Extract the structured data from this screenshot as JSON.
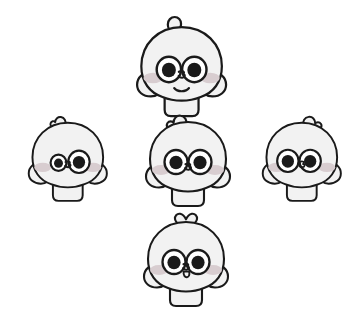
{
  "canvas": {
    "width": 342,
    "height": 306,
    "background_color": "#ffffff"
  },
  "palette": {
    "outline": "#1a1a1a",
    "body_fill": "#f2f2f2",
    "body_shade": "#e8e8e8",
    "cheek": "#d8cdd0",
    "pupil": "#1a1a1a",
    "eye_white": "#ffffff"
  },
  "scene": {
    "title": "Cartoon character expression sheet",
    "description": "Five identical round cartoon characters arranged in a plus/diamond formation, each showing a different facial expression and head tuft.",
    "layout": "diamond",
    "character_count": 5
  },
  "characters": [
    {
      "id": "top",
      "name": "character-top",
      "position_label": "top-center",
      "x": 118,
      "y": 8,
      "scale": 1.06,
      "tuft": "small-round-bump",
      "tuft_side": "left",
      "expression": "happy-smile",
      "gaze": "center",
      "mouth": "smile-curve",
      "left_eye": {
        "size": "large",
        "pupil": "large",
        "offset_x": 0,
        "offset_y": 0
      },
      "right_eye": {
        "size": "large",
        "pupil": "large",
        "offset_x": 0,
        "offset_y": 0
      },
      "cheeks": "both",
      "has_body": true
    },
    {
      "id": "left",
      "name": "character-left",
      "position_label": "middle-left",
      "x": 12,
      "y": 106,
      "scale": 0.93,
      "tuft": "heart-curl",
      "tuft_side": "left",
      "expression": "squint-wink",
      "gaze": "down-right",
      "mouth": "tiny-nose-only",
      "left_eye": {
        "size": "small",
        "pupil": "small",
        "offset_x": 2,
        "offset_y": 3
      },
      "right_eye": {
        "size": "large",
        "pupil": "large",
        "offset_x": 0,
        "offset_y": 2
      },
      "cheeks": "both",
      "has_body": true
    },
    {
      "id": "center",
      "name": "character-center",
      "position_label": "middle-center",
      "x": 128,
      "y": 104,
      "scale": 1.0,
      "tuft": "curl-swirl",
      "tuft_side": "left",
      "expression": "neutral-curious",
      "gaze": "center",
      "mouth": "tiny-nose-only",
      "left_eye": {
        "size": "large",
        "pupil": "large",
        "offset_x": 0,
        "offset_y": 0
      },
      "right_eye": {
        "size": "large",
        "pupil": "large",
        "offset_x": 0,
        "offset_y": 0
      },
      "cheeks": "both",
      "has_body": true
    },
    {
      "id": "right",
      "name": "character-right",
      "position_label": "middle-right",
      "x": 246,
      "y": 106,
      "scale": 0.93,
      "tuft": "curl-swirl",
      "tuft_side": "right",
      "expression": "looking-left",
      "gaze": "left",
      "mouth": "tiny-nose-only",
      "left_eye": {
        "size": "large",
        "pupil": "large",
        "offset_x": -3,
        "offset_y": 1
      },
      "right_eye": {
        "size": "large",
        "pupil": "large",
        "offset_x": -3,
        "offset_y": 1
      },
      "cheeks": "both",
      "has_body": true
    },
    {
      "id": "bottom",
      "name": "character-bottom",
      "position_label": "bottom-center",
      "x": 126,
      "y": 204,
      "scale": 1.0,
      "tuft": "heart",
      "tuft_side": "center",
      "expression": "tongue-out",
      "gaze": "center",
      "mouth": "small-tongue",
      "left_eye": {
        "size": "large",
        "pupil": "large",
        "offset_x": 0,
        "offset_y": 0
      },
      "right_eye": {
        "size": "large",
        "pupil": "large",
        "offset_x": 0,
        "offset_y": 0
      },
      "cheeks": "both",
      "has_body": true
    }
  ]
}
